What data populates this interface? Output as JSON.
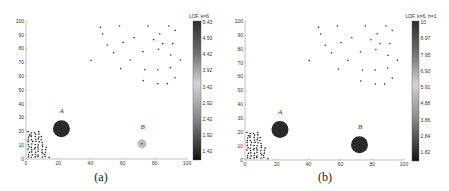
{
  "chart_data": [
    {
      "type": "scatter",
      "panel_label": "(a)",
      "colorbar": {
        "title": "LOF, k=6",
        "ticks": [
          "5.43",
          "4.93",
          "4.42",
          "3.92",
          "3.42",
          "2.92",
          "2.42",
          "1.92",
          "1.42"
        ],
        "range": [
          1.0,
          5.43
        ]
      },
      "xlim": [
        0,
        100
      ],
      "ylim": [
        0,
        100
      ],
      "xticks": [
        "0",
        "20",
        "40",
        "60",
        "80",
        "100"
      ],
      "yticks": [
        "0",
        "10",
        "20",
        "30",
        "40",
        "50",
        "60",
        "70",
        "80",
        "90",
        "100"
      ],
      "annotations": [
        {
          "label": "A",
          "x": 22,
          "y": 22,
          "score": "high",
          "color": "#2a2a2a",
          "radius": 8.5
        },
        {
          "label": "B",
          "x": 72,
          "y": 11,
          "score": "low",
          "color": "#bdbdbd",
          "radius": 4.5
        }
      ],
      "grid": false
    },
    {
      "type": "scatter",
      "panel_label": "(b)",
      "colorbar": {
        "title": "LDF, k=6, h=1",
        "ticks": [
          "10",
          "8.97",
          "7.95",
          "6.93",
          "5.91",
          "4.88",
          "3.86",
          "2.84",
          "1.82"
        ],
        "range": [
          1.0,
          10
        ]
      },
      "xlim": [
        0,
        100
      ],
      "ylim": [
        0,
        100
      ],
      "xticks": [
        "0",
        "20",
        "40",
        "60",
        "80",
        "100"
      ],
      "yticks": [
        "0",
        "10",
        "20",
        "30",
        "40",
        "50",
        "60",
        "70",
        "80",
        "90",
        "100"
      ],
      "annotations": [
        {
          "label": "A",
          "x": 22,
          "y": 22,
          "score": "high",
          "color": "#2a2a2a",
          "radius": 8.5
        },
        {
          "label": "B",
          "x": 72,
          "y": 11,
          "score": "high",
          "color": "#2a2a2a",
          "radius": 8.5
        }
      ],
      "grid": false
    }
  ],
  "sparse_cluster": [
    [
      46.2,
      95.4
    ],
    [
      47.6,
      90.6
    ],
    [
      58.1,
      96.4
    ],
    [
      50.5,
      82.6
    ],
    [
      54.4,
      77.1
    ],
    [
      60.4,
      84.5
    ],
    [
      67.2,
      87.9
    ],
    [
      75.7,
      96.4
    ],
    [
      88.7,
      96.4
    ],
    [
      83.1,
      90.8
    ],
    [
      92.6,
      93.2
    ],
    [
      79.2,
      86.5
    ],
    [
      84.9,
      83.6
    ],
    [
      91.1,
      83.6
    ],
    [
      82.3,
      79.5
    ],
    [
      72.6,
      77.8
    ],
    [
      89.9,
      75.4
    ],
    [
      95.9,
      71.7
    ],
    [
      64.7,
      71.7
    ],
    [
      40.4,
      71.5
    ],
    [
      58.8,
      65.5
    ],
    [
      73.8,
      64.7
    ],
    [
      81.9,
      64.7
    ],
    [
      89.7,
      66.2
    ],
    [
      92.6,
      58.9
    ],
    [
      72.8,
      56.8
    ],
    [
      81.9,
      54.6
    ],
    [
      87.8,
      54.6
    ]
  ],
  "dense_cluster_bounds": {
    "x": [
      1,
      14
    ],
    "y": [
      1,
      20
    ]
  }
}
